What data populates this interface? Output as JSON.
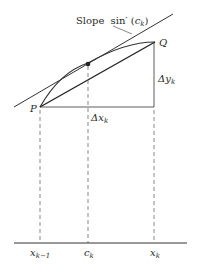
{
  "figure": {
    "type": "mean value theorem diagram for arc length",
    "labels": {
      "slope_prefix": "Slope",
      "slope_func": "sin′",
      "slope_arg_open": "(",
      "slope_arg_var": "c",
      "slope_arg_sub": "k",
      "slope_arg_close": ")",
      "P": "P",
      "Q": "Q",
      "delta_y": "Δy",
      "delta_y_sub": "k",
      "delta_x": "Δx",
      "delta_x_sub": "k",
      "axis_x_km1": "x",
      "axis_x_km1_sub": "k−1",
      "axis_c": "c",
      "axis_c_sub": "k",
      "axis_x_k": "x",
      "axis_x_k_sub": "k"
    },
    "colors": {
      "stroke": "#333333",
      "dashed": "#555555",
      "background": "#ffffff"
    }
  }
}
